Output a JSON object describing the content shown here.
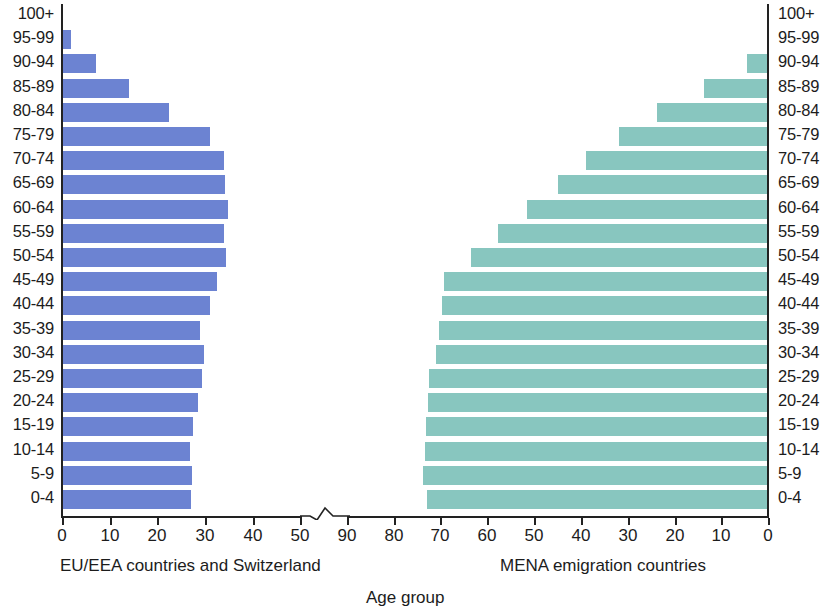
{
  "chart_data": {
    "type": "bar",
    "subtype": "population-pyramid",
    "title": "",
    "xlabel": "Age group",
    "ylabel": "",
    "categories": [
      "0-4",
      "5-9",
      "10-14",
      "15-19",
      "20-24",
      "25-29",
      "30-34",
      "35-39",
      "40-44",
      "45-49",
      "50-54",
      "55-59",
      "60-64",
      "65-69",
      "70-74",
      "75-79",
      "80-84",
      "85-89",
      "90-94",
      "95-99",
      "100+"
    ],
    "series": [
      {
        "name": "EU/EEA countries and Switzerland",
        "side": "left",
        "color": "#6c83d2",
        "values": [
          27.0,
          27.2,
          26.9,
          27.5,
          28.6,
          29.3,
          29.8,
          29.0,
          31.0,
          32.4,
          34.4,
          34.0,
          34.7,
          34.2,
          33.9,
          31.0,
          22.5,
          14.0,
          7.2,
          1.8,
          0.0
        ]
      },
      {
        "name": "MENA emigration countries",
        "side": "right",
        "color": "#88c6bf",
        "values": [
          72.0,
          73.0,
          72.5,
          72.3,
          71.8,
          71.6,
          70.2,
          69.5,
          68.9,
          68.5,
          62.8,
          57.0,
          51.0,
          44.5,
          38.5,
          31.5,
          23.5,
          13.5,
          4.5,
          0.0,
          0.0
        ]
      }
    ],
    "axis": {
      "left_ticks": [
        {
          "label": "0",
          "value": 0,
          "x": 62
        },
        {
          "label": "10",
          "value": 10,
          "x": 110
        },
        {
          "label": "20",
          "value": 20,
          "x": 157
        },
        {
          "label": "30",
          "value": 30,
          "x": 205
        },
        {
          "label": "40",
          "value": 40,
          "x": 253
        },
        {
          "label": "50",
          "value": 50,
          "x": 300
        }
      ],
      "right_ticks": [
        {
          "label": "90",
          "value": 90,
          "x": 347
        },
        {
          "label": "80",
          "value": 80,
          "x": 394
        },
        {
          "label": "70",
          "value": 70,
          "x": 440
        },
        {
          "label": "60",
          "value": 60,
          "x": 487
        },
        {
          "label": "50",
          "value": 50,
          "x": 534
        },
        {
          "label": "40",
          "value": 40,
          "x": 581
        },
        {
          "label": "30",
          "value": 30,
          "x": 628
        },
        {
          "label": "20",
          "value": 20,
          "x": 675
        },
        {
          "label": "10",
          "value": 10,
          "x": 721
        },
        {
          "label": "0",
          "value": 0,
          "x": 768
        }
      ],
      "has_break": true,
      "break_between": [
        50,
        90
      ],
      "grid": false,
      "legend": "none"
    }
  },
  "captions": {
    "left": "EU/EEA countries and Switzerland",
    "right": "MENA emigration countries",
    "axis_title": "Age group"
  }
}
